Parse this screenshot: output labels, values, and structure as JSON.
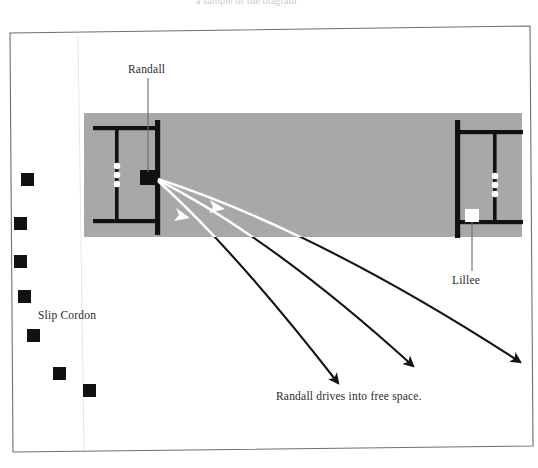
{
  "figure": {
    "kind": "cricket-field-diagram",
    "top_partial_text": "a sample of the diagram",
    "frame": {
      "border_color": "#6e6e76",
      "background_color": "#ffffff"
    },
    "pitch": {
      "fill_color": "#a8a8a8",
      "crease_color": "#111111",
      "left": 84,
      "top": 113,
      "right": 522,
      "bottom": 237
    },
    "labels": {
      "randall": "Randall",
      "lillee": "Lillee",
      "slip_cordon": "Slip Cordon"
    },
    "caption": "Randall drives into free space.",
    "players": {
      "batsman_randall": {
        "x": 148,
        "y": 177,
        "color": "#111111",
        "shape": "square"
      },
      "batsman_lillee": {
        "x": 472,
        "y": 216,
        "color": "#ffffff",
        "shape": "square"
      },
      "stumps_color": "#ffffff",
      "stumps_left": [
        {
          "x": 117,
          "y": 166
        },
        {
          "x": 117,
          "y": 174
        },
        {
          "x": 117,
          "y": 182
        }
      ],
      "stumps_right": [
        {
          "x": 495,
          "y": 175
        },
        {
          "x": 495,
          "y": 183
        },
        {
          "x": 495,
          "y": 191
        }
      ]
    },
    "slip_cordon_fielders": [
      {
        "x": 27,
        "y": 180
      },
      {
        "x": 21,
        "y": 224
      },
      {
        "x": 21,
        "y": 262
      },
      {
        "x": 25,
        "y": 297
      },
      {
        "x": 33,
        "y": 336
      },
      {
        "x": 60,
        "y": 374
      },
      {
        "x": 89,
        "y": 390
      }
    ],
    "shot_arrows": {
      "origin": {
        "x": 158,
        "y": 180
      },
      "inside_color": "#ffffff",
      "outside_color": "#111111",
      "paths": [
        {
          "name": "shot-1-straight",
          "end_x": 338,
          "end_y": 383,
          "mid_x": 228,
          "mid_y": 245
        },
        {
          "name": "shot-2-mid",
          "end_x": 413,
          "end_y": 366,
          "mid_x": 268,
          "mid_y": 236
        },
        {
          "name": "shot-3-wide",
          "end_x": 520,
          "end_y": 362,
          "mid_x": 316,
          "mid_y": 231
        }
      ]
    },
    "leader_lines": {
      "randall_leader": {
        "x1": 148,
        "y1": 78,
        "x2": 148,
        "y2": 172
      },
      "lillee_leader": {
        "x1": 472,
        "y1": 222,
        "x2": 472,
        "y2": 270
      }
    }
  }
}
